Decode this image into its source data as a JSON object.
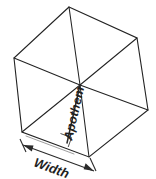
{
  "diagram": {
    "type": "geometry-figure",
    "background_color": "#ffffff",
    "stroke_color": "#232323",
    "guide_color": "#8c8c8c",
    "labels": {
      "apothem": "Apothem",
      "width": "Width"
    },
    "shape": {
      "name": "hexagon",
      "vertex_count": 6,
      "vertices": [
        {
          "id": "top",
          "x": 69,
          "y": 7
        },
        {
          "id": "upper-right",
          "x": 137,
          "y": 38
        },
        {
          "id": "lower-right",
          "x": 148,
          "y": 110
        },
        {
          "id": "bottom",
          "x": 89,
          "y": 157
        },
        {
          "id": "bottom-left",
          "x": 22,
          "y": 132
        },
        {
          "id": "upper-left",
          "x": 14,
          "y": 58
        }
      ],
      "center": {
        "x": 80,
        "y": 85
      }
    },
    "apothem": {
      "from": {
        "x": 80,
        "y": 85
      },
      "to": {
        "x": 67,
        "y": 142
      },
      "has_right_angle_marker": true,
      "label_rotation_deg": -77
    },
    "guides": {
      "center_to_bottom_left": {
        "from": {
          "x": 80,
          "y": 85
        },
        "to": {
          "x": 22,
          "y": 132
        }
      },
      "edge_parallel": {
        "from": {
          "x": 25,
          "y": 137
        },
        "to": {
          "x": 72,
          "y": 155
        }
      }
    },
    "dimension": {
      "id": "width-dimension",
      "from": {
        "x": 24,
        "y": 146
      },
      "to": {
        "x": 94,
        "y": 172
      },
      "arrowheads": "both",
      "label_rotation_deg": 20
    }
  }
}
